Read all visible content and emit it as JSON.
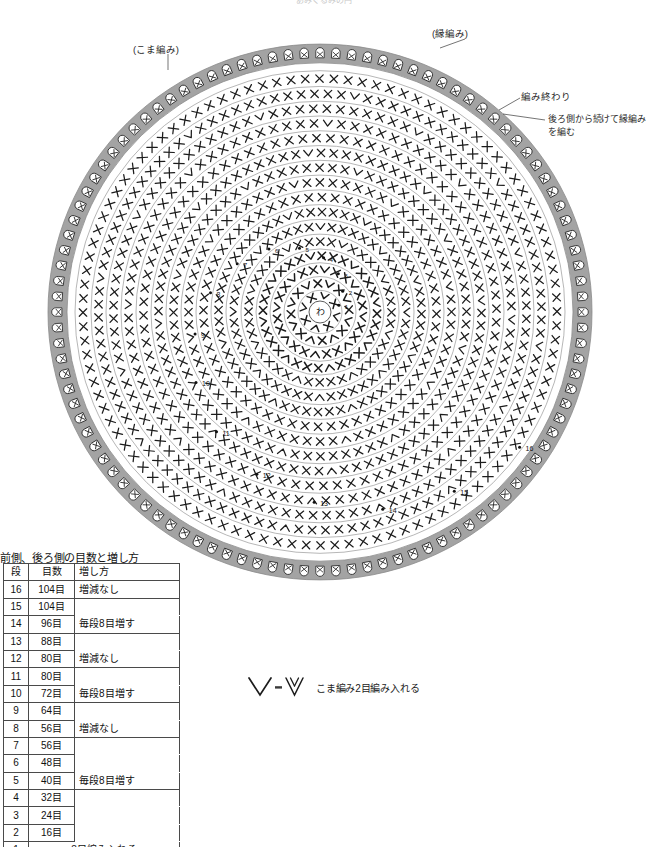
{
  "page": {
    "cut_off_title": "あみぐるみの円",
    "background": "#ffffff"
  },
  "annotations": [
    {
      "id": "koma",
      "text": "(こま編み)",
      "x": 133,
      "y": 44
    },
    {
      "id": "fuchi",
      "text": "(縁編み)",
      "x": 432,
      "y": 28
    },
    {
      "id": "end",
      "text": "編み終わり",
      "x": 521,
      "y": 91
    },
    {
      "id": "cont",
      "text": "後ろ側から続けて縁編みを編む",
      "x": 548,
      "y": 113
    }
  ],
  "chart": {
    "center": {
      "x": 320,
      "y": 294
    },
    "magic_ring_label": "わ",
    "magic_ring_radius": 11,
    "outer_band_color": "#a3a3a3",
    "outer_band_inner_r": 253,
    "outer_band_outer_r": 272,
    "ring_line_color": "#8d8d8d",
    "symbol_color": "#1c1c1c",
    "round_numbers": [
      1,
      2,
      3,
      4,
      5,
      6,
      7,
      8,
      9,
      10,
      11,
      12,
      13,
      14,
      15,
      16
    ],
    "rounds": [
      {
        "round": 1,
        "stitches": 8,
        "radius": 22,
        "increase": true
      },
      {
        "round": 2,
        "stitches": 16,
        "radius": 36,
        "increase": true
      },
      {
        "round": 3,
        "stitches": 24,
        "radius": 50,
        "increase": true
      },
      {
        "round": 4,
        "stitches": 32,
        "radius": 64,
        "increase": true
      },
      {
        "round": 5,
        "stitches": 40,
        "radius": 79,
        "increase": true
      },
      {
        "round": 6,
        "stitches": 48,
        "radius": 94,
        "increase": true
      },
      {
        "round": 7,
        "stitches": 56,
        "radius": 109,
        "increase": true
      },
      {
        "round": 8,
        "stitches": 56,
        "radius": 124,
        "increase": false
      },
      {
        "round": 9,
        "stitches": 64,
        "radius": 139,
        "increase": true
      },
      {
        "round": 10,
        "stitches": 72,
        "radius": 154,
        "increase": true
      },
      {
        "round": 11,
        "stitches": 80,
        "radius": 169,
        "increase": true
      },
      {
        "round": 12,
        "stitches": 80,
        "radius": 184,
        "increase": false
      },
      {
        "round": 13,
        "stitches": 88,
        "radius": 199,
        "increase": true
      },
      {
        "round": 14,
        "stitches": 96,
        "radius": 214,
        "increase": true
      },
      {
        "round": 15,
        "stitches": 104,
        "radius": 229,
        "increase": true
      },
      {
        "round": 16,
        "stitches": 104,
        "radius": 245,
        "increase": false
      }
    ],
    "edge_round": {
      "stitches": 104,
      "symbol": "crab-stitch"
    }
  },
  "legend": {
    "symbol_left": "V",
    "equals": "=",
    "symbol_right": "VV",
    "text": "こま編み2目編み入れる"
  },
  "table": {
    "title": "前側、後ろ側の目数と増し方",
    "headers": [
      "段",
      "目数",
      "増し方"
    ],
    "rows": [
      {
        "dan": "16",
        "me": "104目",
        "mashi": "増減なし"
      },
      {
        "dan": "15",
        "me": "104目",
        "mashi": ""
      },
      {
        "dan": "14",
        "me": "96目",
        "mashi": "毎段8目増す"
      },
      {
        "dan": "13",
        "me": "88目",
        "mashi": ""
      },
      {
        "dan": "12",
        "me": "80目",
        "mashi": "増減なし"
      },
      {
        "dan": "11",
        "me": "80目",
        "mashi": ""
      },
      {
        "dan": "10",
        "me": "72目",
        "mashi": "毎段8目増す"
      },
      {
        "dan": "9",
        "me": "64目",
        "mashi": ""
      },
      {
        "dan": "8",
        "me": "56目",
        "mashi": "増減なし"
      },
      {
        "dan": "7",
        "me": "56目",
        "mashi": ""
      },
      {
        "dan": "6",
        "me": "48目",
        "mashi": ""
      },
      {
        "dan": "5",
        "me": "40目",
        "mashi": "毎段8目増す"
      },
      {
        "dan": "4",
        "me": "32目",
        "mashi": ""
      },
      {
        "dan": "3",
        "me": "24目",
        "mashi": ""
      },
      {
        "dan": "2",
        "me": "16目",
        "mashi": ""
      }
    ],
    "last_row": {
      "dan": "1",
      "text": "8目編み入れる"
    }
  }
}
